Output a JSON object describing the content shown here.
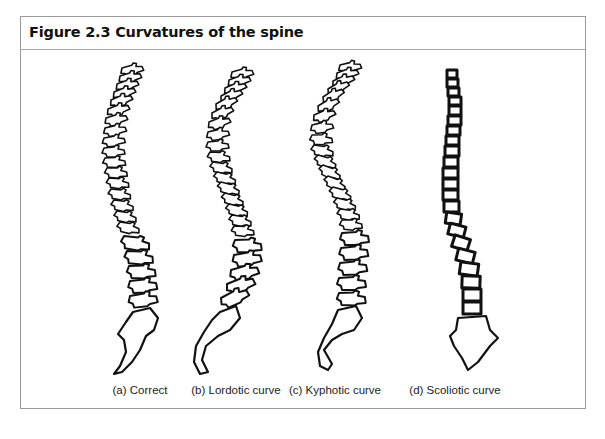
{
  "figure": {
    "title": "Figure 2.3 Curvatures of the spine",
    "panels": [
      {
        "id": "a",
        "caption": "(a) Correct",
        "style": "anatomical-outline"
      },
      {
        "id": "b",
        "caption": "(b) Lordotic curve",
        "style": "anatomical-outline"
      },
      {
        "id": "c",
        "caption": "(c) Kyphotic curve",
        "style": "anatomical-outline"
      },
      {
        "id": "d",
        "caption": "(d) Scoliotic curve",
        "style": "block-stack"
      }
    ]
  },
  "colors": {
    "frame_border": "#9a9a9a",
    "title_rule": "#a8a8a8",
    "ink": "#111111",
    "background": "#ffffff"
  }
}
